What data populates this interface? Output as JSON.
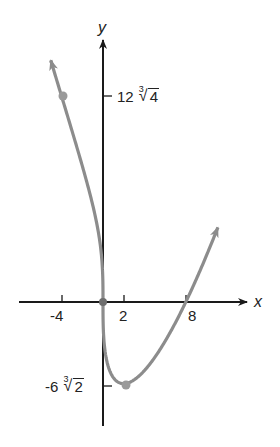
{
  "chart_data": {
    "type": "line",
    "title": "",
    "function": "f(x) = x^(1/3)(x - 8)",
    "xlabel": "x",
    "ylabel": "y",
    "x_ticks": [
      {
        "value": -4,
        "label": "-4"
      },
      {
        "value": 2,
        "label": "2"
      },
      {
        "value": 8,
        "label": "8"
      }
    ],
    "y_ticks": [
      {
        "value": 19.05,
        "label": "12∛4",
        "coef": "12",
        "index": "3",
        "radicand": "4"
      },
      {
        "value": -7.56,
        "label": "-6∛2",
        "coef": "-6",
        "index": "3",
        "radicand": "2"
      }
    ],
    "marked_points": [
      {
        "x": -4,
        "y": 19.05,
        "label": "(-4, 12∛4)"
      },
      {
        "x": 0,
        "y": 0,
        "label": "(0, 0)"
      },
      {
        "x": 2,
        "y": -7.56,
        "label": "(2, -6∛2)"
      }
    ],
    "x_intercepts": [
      0,
      8
    ],
    "xlim": [
      -8,
      14
    ],
    "ylim": [
      -11.5,
      24
    ],
    "grid": false,
    "legend": null,
    "colors": {
      "curve": "#8c8c8c",
      "axes": "#1a1a1a",
      "points": "#9a9a9a"
    }
  }
}
